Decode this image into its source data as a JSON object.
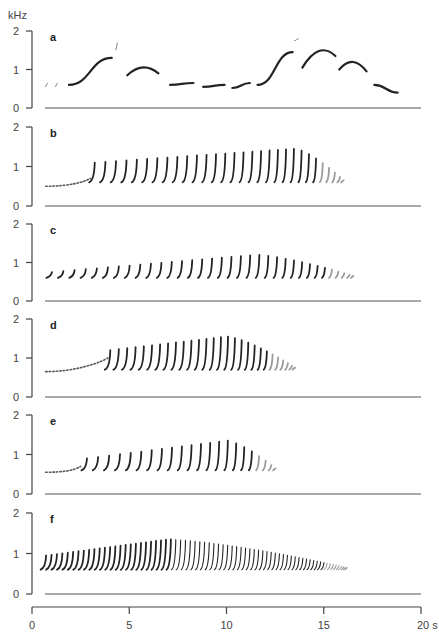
{
  "chart_data": {
    "type": "spectrogram",
    "title": "",
    "ylabel": "kHz",
    "xlabel": "s",
    "x_ticks": [
      "0",
      "5",
      "10",
      "15",
      "20 s"
    ],
    "x_tick_values": [
      0,
      5,
      10,
      15,
      20
    ],
    "xlim": [
      0,
      20
    ],
    "y_ticks": [
      "0",
      "1",
      "2"
    ],
    "ylim": [
      0,
      2
    ],
    "grid": false,
    "legend": null,
    "panels": [
      {
        "label": "a",
        "description": "Slow song of distinct frequency-modulated notes",
        "notes": [
          {
            "t0": 0.7,
            "t1": 0.8,
            "f0": 0.55,
            "f1": 0.65
          },
          {
            "t0": 1.2,
            "t1": 1.3,
            "f0": 0.55,
            "f1": 0.65
          },
          {
            "t0": 1.9,
            "t1": 4.1,
            "f0": 0.6,
            "f1": 1.3
          },
          {
            "t0": 4.3,
            "t1": 4.4,
            "f0": 1.5,
            "f1": 1.7
          },
          {
            "t0": 4.9,
            "t1": 6.5,
            "f0": 0.85,
            "f1": 0.9,
            "peak": 1.1
          },
          {
            "t0": 7.1,
            "t1": 8.3,
            "f0": 0.6,
            "f1": 0.65
          },
          {
            "t0": 8.8,
            "t1": 9.9,
            "f0": 0.55,
            "f1": 0.6
          },
          {
            "t0": 10.3,
            "t1": 11.2,
            "f0": 0.52,
            "f1": 0.65
          },
          {
            "t0": 11.6,
            "t1": 13.4,
            "f0": 0.6,
            "f1": 1.45
          },
          {
            "t0": 13.5,
            "t1": 13.7,
            "f0": 1.75,
            "f1": 1.8
          },
          {
            "t0": 13.9,
            "t1": 15.6,
            "f0": 1.05,
            "f1": 1.35,
            "peak": 1.55
          },
          {
            "t0": 15.8,
            "t1": 17.2,
            "f0": 1.0,
            "f1": 0.95,
            "peak": 1.25
          },
          {
            "t0": 17.6,
            "t1": 18.8,
            "f0": 0.6,
            "f1": 0.4
          }
        ]
      },
      {
        "label": "b",
        "description": "Trill of upsweeps rising to ~1.4 kHz then fading",
        "intro": {
          "t0": 0.7,
          "t1": 3.0,
          "f0": 0.5,
          "f1": 0.6
        },
        "elements": {
          "count": 30,
          "t_start": 3.2,
          "t_end": 16.0,
          "f_low": 0.6,
          "f_high_start": 1.1,
          "f_high_peak": 1.45,
          "t_peak": 13.5
        }
      },
      {
        "label": "c",
        "description": "Trill of upsweeps, plateau near 1.2 kHz",
        "elements": {
          "count": 34,
          "t_start": 1.0,
          "t_end": 16.5,
          "f_low": 0.6,
          "f_high_start": 0.75,
          "f_high_peak": 1.2,
          "t_peak": 11.5
        }
      },
      {
        "label": "d",
        "description": "Dense trill peaking ~1.55 kHz around 9–10 s",
        "intro": {
          "t0": 0.7,
          "t1": 3.9,
          "f0": 0.65,
          "f1": 0.9
        },
        "elements": {
          "count": 28,
          "t_start": 4.0,
          "t_end": 13.5,
          "f_low": 0.7,
          "f_high_start": 1.2,
          "f_high_peak": 1.55,
          "t_peak": 10.0
        }
      },
      {
        "label": "e",
        "description": "Trill of upsweeps peaking ~1.35 kHz",
        "intro": {
          "t0": 0.7,
          "t1": 2.5,
          "f0": 0.55,
          "f1": 0.6
        },
        "elements": {
          "count": 22,
          "t_start": 2.8,
          "t_end": 12.5,
          "f_low": 0.6,
          "f_high_start": 0.9,
          "f_high_peak": 1.35,
          "t_peak": 10.0
        }
      },
      {
        "label": "f",
        "description": "Accelerating trill becoming a dense buzz and fading by ~16 s",
        "elements": {
          "count": 70,
          "t_start": 0.7,
          "t_end": 16.2,
          "f_low": 0.6,
          "f_high_start": 0.95,
          "f_high_peak": 1.35,
          "t_peak": 7.0
        }
      }
    ]
  },
  "figure": {
    "ylabel": "kHz",
    "y_tick_labels": [
      "2",
      "1",
      "0"
    ],
    "x_tick_labels": [
      "0",
      "5",
      "10",
      "15",
      "20 s"
    ],
    "panel_labels": [
      "a",
      "b",
      "c",
      "d",
      "e",
      "f"
    ]
  }
}
